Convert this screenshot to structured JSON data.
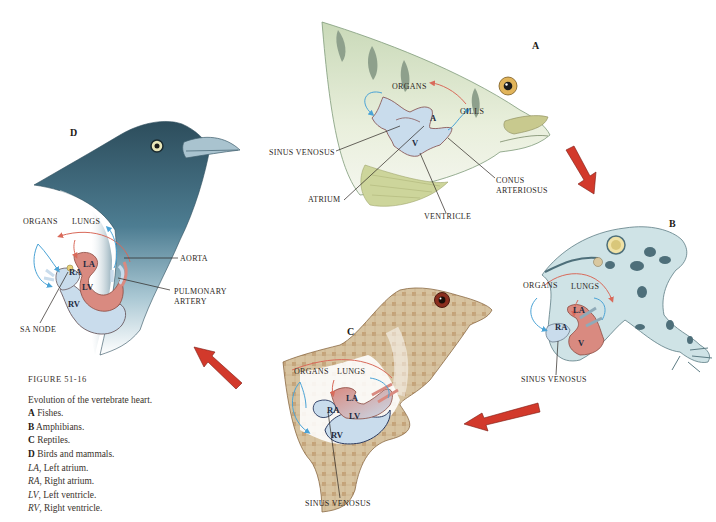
{
  "figure": {
    "number_label": "FIGURE 51-16",
    "title": "Evolution of the vertebrate heart.",
    "legend": [
      {
        "key": "A",
        "style": "bold",
        "text": "Fishes."
      },
      {
        "key": "B",
        "style": "bold",
        "text": "Amphibians."
      },
      {
        "key": "C",
        "style": "bold",
        "text": "Reptiles."
      },
      {
        "key": "D",
        "style": "bold",
        "text": "Birds and mammals."
      },
      {
        "key": "LA",
        "style": "italic",
        "text": ", Left atrium."
      },
      {
        "key": "RA",
        "style": "italic",
        "text": ", Right atrium."
      },
      {
        "key": "LV",
        "style": "italic",
        "text": ", Left ventricle."
      },
      {
        "key": "RV",
        "style": "italic",
        "text": ", Right ventricle."
      }
    ]
  },
  "colors": {
    "oxygenated": "#d96a5a",
    "deoxygenated": "#4aa3d6",
    "arrow_red": "#d2392b",
    "heart_blue": "#c9dcec",
    "heart_pink": "#d98a80"
  },
  "panels": {
    "A": {
      "letter": "A",
      "animal": "fish",
      "labels": {
        "organs": "ORGANS",
        "gills": "GILLS",
        "sinus_venosus": "SINUS VENOSUS",
        "atrium": "ATRIUM",
        "ventricle": "VENTRICLE",
        "conus_arteriosus_1": "CONUS",
        "conus_arteriosus_2": "ARTERIOSUS",
        "chamber_a": "A",
        "chamber_v": "V"
      }
    },
    "B": {
      "letter": "B",
      "animal": "frog",
      "labels": {
        "organs": "ORGANS",
        "lungs": "LUNGS",
        "sinus_venosus": "SINUS VENOSUS",
        "chamber_la": "LA",
        "chamber_ra": "RA",
        "chamber_v": "V"
      }
    },
    "C": {
      "letter": "C",
      "animal": "lizard",
      "labels": {
        "organs": "ORGANS",
        "lungs": "LUNGS",
        "sinus_venosus": "SINUS VENOSUS",
        "chamber_la": "LA",
        "chamber_ra": "RA",
        "chamber_lv": "LV",
        "chamber_rv": "RV"
      }
    },
    "D": {
      "letter": "D",
      "animal": "bird",
      "labels": {
        "organs": "ORGANS",
        "lungs": "LUNGS",
        "aorta": "AORTA",
        "pulmonary_artery_1": "PULMONARY",
        "pulmonary_artery_2": "ARTERY",
        "sa_node": "SA NODE",
        "chamber_la": "LA",
        "chamber_ra": "RA",
        "chamber_lv": "LV",
        "chamber_rv": "RV"
      }
    }
  },
  "sequence_arrows": [
    "A-to-B",
    "B-to-C",
    "C-to-D"
  ]
}
